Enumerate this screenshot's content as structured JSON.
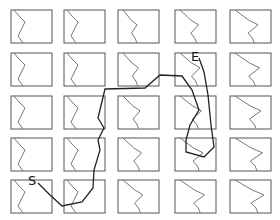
{
  "diagram": {
    "type": "grid-path",
    "grid": {
      "rows": 5,
      "cols": 5
    },
    "cell_origin_x": [
      11,
      64,
      118,
      175,
      230
    ],
    "cell_origin_y": [
      10,
      53,
      96,
      138,
      180
    ],
    "cell_size": {
      "w": 41,
      "h": 33
    },
    "start_label": "S",
    "end_label": "E",
    "start_pos": {
      "x": 34,
      "y": 180
    },
    "end_pos": {
      "x": 197,
      "y": 59
    },
    "colors": {
      "cell_border": "#555555",
      "cell_curve": "#777777",
      "path": "#222222",
      "label": "#111111"
    }
  }
}
